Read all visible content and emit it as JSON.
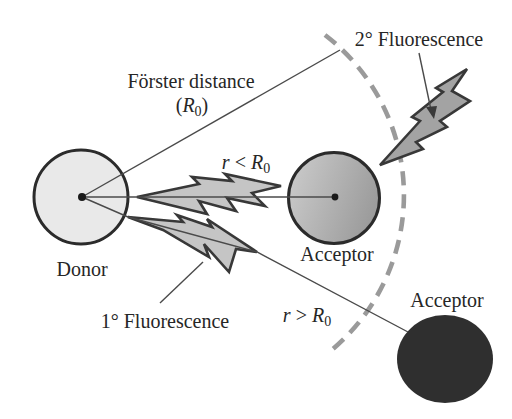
{
  "figure": {
    "labels": {
      "forster_distance": "Förster distance",
      "paren_open": "(",
      "R": "R",
      "sub_zero": "0",
      "paren_close": ")",
      "r": "r",
      "less_than": "<",
      "greater_than": ">",
      "donor": "Donor",
      "acceptor_near": "Acceptor",
      "acceptor_far": "Acceptor",
      "primary_fluorescence": "1° Fluorescence",
      "secondary_fluorescence": "2° Fluorescence"
    },
    "colors": {
      "donor_fill": "#e9e9e9",
      "acceptor_near_light": "#cccccc",
      "acceptor_near_dark": "#9c9c9c",
      "acceptor_far_fill": "#2f2f2f",
      "bolt_fill": "#c5c5c5",
      "bolt_fill_secondary": "#a3a3a3",
      "arc": "#9a9a9a",
      "line": "#4a4a4a",
      "text": "#262626"
    },
    "icons": {
      "energy_transfer_bolt": "lightning-bolt-icon",
      "primary_fluorescence_bolt": "lightning-bolt-icon",
      "secondary_fluorescence_bolt": "lightning-bolt-icon"
    }
  }
}
